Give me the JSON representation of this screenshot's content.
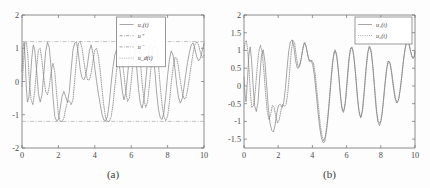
{
  "figure": {
    "background_color": "#fdfdfd",
    "axis_color": "#6e6e6e",
    "curve_color": "#8a8a8a",
    "reference_color": "#a9a9a9"
  },
  "panels": [
    {
      "id": "a",
      "caption": "(a)",
      "legend": {
        "position": "top-center",
        "entries": [
          {
            "label": "u₁(t)",
            "style": "solid"
          },
          {
            "label": "u⁺",
            "style": "dash-dot"
          },
          {
            "label": "u⁻",
            "style": "dash-dot"
          },
          {
            "label": "u_d(t)",
            "style": "dotted"
          }
        ]
      }
    },
    {
      "id": "b",
      "caption": "(b)",
      "legend": {
        "position": "top-right",
        "entries": [
          {
            "label": "u₁(t)",
            "style": "solid"
          },
          {
            "label": "u₂(t)",
            "style": "dotted"
          }
        ]
      }
    }
  ],
  "chart_data": [
    {
      "type": "line",
      "panel": "a",
      "title": "",
      "subtitle": "",
      "xlabel": "",
      "ylabel": "",
      "caption": "(a)",
      "xlim": [
        0,
        10
      ],
      "ylim": [
        -2,
        2
      ],
      "xticks": [
        0,
        2,
        4,
        6,
        8,
        10
      ],
      "yticks": [
        -2,
        -1,
        0,
        1,
        2
      ],
      "xticklabels": [
        "0",
        "2",
        "4",
        "6",
        "8",
        "10"
      ],
      "yticklabels": [
        "-2",
        "-1",
        "0",
        "1",
        "2"
      ],
      "grid": false,
      "legend_position": "top-center",
      "annotations": [
        {
          "type": "hline",
          "label": "u⁺",
          "value": 1.2,
          "style": "dash-dot"
        },
        {
          "type": "hline",
          "label": "u⁻",
          "value": -1.2,
          "style": "dash-dot"
        }
      ],
      "series": [
        {
          "name": "u₁(t)",
          "style": "solid",
          "x": [
            0.0,
            0.06,
            0.12,
            0.18,
            0.24,
            0.3,
            0.38,
            0.46,
            0.54,
            0.62,
            0.7,
            0.8,
            0.9,
            1.0,
            1.1,
            1.2,
            1.3,
            1.4,
            1.5,
            1.6,
            1.7,
            1.8,
            1.9,
            2.0,
            2.1,
            2.2,
            2.3,
            2.4,
            2.5,
            2.6,
            2.7,
            2.8,
            2.9,
            3.0,
            3.1,
            3.2,
            3.3,
            3.4,
            3.5,
            3.6,
            3.7,
            3.8,
            3.9,
            4.0,
            4.1,
            4.2,
            4.3,
            4.4,
            4.5,
            4.6,
            4.7,
            4.8,
            4.9,
            5.0,
            5.1,
            5.2,
            5.3,
            5.4,
            5.5,
            5.6,
            5.7,
            5.8,
            5.9,
            6.0,
            6.1,
            6.2,
            6.3,
            6.4,
            6.5,
            6.6,
            6.7,
            6.8,
            6.9,
            7.0,
            7.1,
            7.2,
            7.3,
            7.4,
            7.5,
            7.6,
            7.7,
            7.8,
            7.9,
            8.0,
            8.1,
            8.2,
            8.3,
            8.4,
            8.5,
            8.6,
            8.7,
            8.8,
            8.9,
            9.0,
            9.1,
            9.2,
            9.3,
            9.4,
            9.5,
            9.6,
            9.7,
            9.8,
            9.9,
            10.0
          ],
          "y": [
            0.3,
            1.05,
            1.18,
            0.6,
            -0.2,
            -0.62,
            -0.48,
            0.1,
            0.72,
            1.1,
            0.95,
            0.35,
            -0.35,
            -0.62,
            -0.4,
            0.25,
            0.9,
            1.18,
            1.02,
            0.4,
            -0.45,
            -1.05,
            -1.18,
            -1.15,
            -0.8,
            -0.45,
            -0.3,
            -0.45,
            -0.62,
            -0.3,
            0.35,
            0.95,
            1.16,
            1.18,
            0.82,
            0.36,
            0.1,
            0.05,
            0.18,
            0.52,
            0.92,
            1.1,
            0.84,
            0.4,
            0.0,
            -0.38,
            -0.7,
            -1.0,
            -1.16,
            -1.18,
            -1.05,
            -0.62,
            -0.05,
            0.45,
            0.8,
            0.96,
            0.72,
            0.26,
            -0.25,
            -0.55,
            -0.36,
            0.18,
            0.74,
            1.08,
            1.18,
            0.95,
            0.42,
            -0.22,
            -0.66,
            -0.8,
            -0.55,
            0.02,
            0.62,
            1.02,
            1.14,
            0.88,
            0.32,
            -0.35,
            -0.85,
            -1.1,
            -1.14,
            -0.92,
            -0.42,
            0.18,
            0.66,
            0.92,
            0.8,
            0.4,
            -0.1,
            -0.48,
            -0.65,
            -0.52,
            -0.18,
            0.22,
            0.58,
            0.88,
            1.1,
            1.16,
            0.98,
            0.74,
            0.62,
            0.7,
            0.92,
            1.14
          ]
        },
        {
          "name": "u_d(t)",
          "style": "dotted",
          "x": [
            0.0,
            0.08,
            0.16,
            0.24,
            0.32,
            0.4,
            0.5,
            0.6,
            0.7,
            0.8,
            0.9,
            1.0,
            1.1,
            1.2,
            1.3,
            1.4,
            1.5,
            1.6,
            1.7,
            1.8,
            1.9,
            2.0,
            2.1,
            2.2,
            2.3,
            2.4,
            2.5,
            2.6,
            2.7,
            2.8,
            2.9,
            3.0,
            3.1,
            3.2,
            3.3,
            3.4,
            3.5,
            3.6,
            3.7,
            3.8,
            3.9,
            4.0,
            4.1,
            4.2,
            4.3,
            4.4,
            4.5,
            4.6,
            4.7,
            4.8,
            4.9,
            5.0,
            5.1,
            5.2,
            5.3,
            5.4,
            5.5,
            5.6,
            5.7,
            5.8,
            5.9,
            6.0,
            6.1,
            6.2,
            6.3,
            6.4,
            6.5,
            6.6,
            6.7,
            6.8,
            6.9,
            7.0,
            7.1,
            7.2,
            7.3,
            7.4,
            7.5,
            7.6,
            7.7,
            7.8,
            7.9,
            8.0,
            8.1,
            8.2,
            8.3,
            8.4,
            8.5,
            8.6,
            8.7,
            8.8,
            8.9,
            9.0,
            9.1,
            9.2,
            9.3,
            9.4,
            9.5,
            9.6,
            9.7,
            9.8,
            9.9,
            10.0
          ],
          "y": [
            -0.15,
            0.55,
            1.15,
            1.2,
            0.8,
            0.05,
            -0.55,
            -0.7,
            -0.3,
            0.4,
            0.95,
            1.0,
            0.6,
            0.1,
            -0.3,
            -0.4,
            -0.15,
            0.28,
            0.55,
            0.3,
            -0.35,
            -1.0,
            -1.2,
            -1.2,
            -1.1,
            -0.82,
            -0.6,
            -0.58,
            -0.7,
            -0.55,
            0.05,
            0.7,
            1.14,
            1.2,
            1.0,
            0.6,
            0.25,
            0.05,
            0.05,
            0.25,
            0.62,
            0.95,
            1.0,
            0.75,
            0.3,
            -0.25,
            -0.75,
            -1.1,
            -1.2,
            -1.2,
            -1.05,
            -0.7,
            -0.15,
            0.35,
            0.7,
            0.82,
            0.65,
            0.22,
            -0.3,
            -0.6,
            -0.5,
            0.0,
            0.58,
            1.02,
            1.2,
            1.08,
            0.62,
            -0.05,
            -0.55,
            -0.78,
            -0.62,
            -0.1,
            0.48,
            0.92,
            1.1,
            0.95,
            0.48,
            -0.18,
            -0.72,
            -1.05,
            -1.18,
            -1.05,
            -0.62,
            -0.05,
            0.42,
            0.72,
            0.7,
            0.42,
            0.02,
            -0.32,
            -0.52,
            -0.5,
            -0.25,
            0.12,
            0.5,
            0.85,
            1.1,
            1.2,
            1.1,
            0.88,
            0.72,
            0.78,
            1.0
          ]
        }
      ]
    },
    {
      "type": "line",
      "panel": "b",
      "title": "",
      "subtitle": "",
      "xlabel": "",
      "ylabel": "",
      "caption": "(b)",
      "xlim": [
        0,
        10
      ],
      "ylim": [
        -1.75,
        2
      ],
      "xticks": [
        0,
        2,
        4,
        6,
        8,
        10
      ],
      "yticks": [
        -1.5,
        -1,
        -0.5,
        0,
        0.5,
        1,
        1.5,
        2
      ],
      "xticklabels": [
        "0",
        "2",
        "4",
        "6",
        "8",
        "10"
      ],
      "yticklabels": [
        "-1.5",
        "-1",
        "-0.5",
        "0",
        "0.5",
        "1",
        "1.5",
        "2"
      ],
      "grid": false,
      "legend_position": "top-right",
      "annotations": [],
      "series": [
        {
          "name": "u₁(t)",
          "style": "solid",
          "x": [
            0.0,
            0.06,
            0.12,
            0.2,
            0.28,
            0.36,
            0.44,
            0.52,
            0.62,
            0.72,
            0.82,
            0.92,
            1.02,
            1.12,
            1.22,
            1.32,
            1.42,
            1.52,
            1.62,
            1.72,
            1.82,
            1.92,
            2.02,
            2.12,
            2.22,
            2.32,
            2.42,
            2.52,
            2.62,
            2.72,
            2.82,
            2.92,
            3.02,
            3.12,
            3.22,
            3.32,
            3.42,
            3.52,
            3.62,
            3.72,
            3.82,
            3.92,
            4.02,
            4.12,
            4.22,
            4.32,
            4.42,
            4.52,
            4.62,
            4.72,
            4.82,
            4.92,
            5.02,
            5.12,
            5.22,
            5.32,
            5.42,
            5.52,
            5.62,
            5.72,
            5.82,
            5.92,
            6.02,
            6.12,
            6.22,
            6.32,
            6.42,
            6.52,
            6.62,
            6.72,
            6.82,
            6.92,
            7.02,
            7.12,
            7.22,
            7.32,
            7.42,
            7.52,
            7.62,
            7.72,
            7.82,
            7.92,
            8.02,
            8.12,
            8.22,
            8.32,
            8.42,
            8.52,
            8.62,
            8.72,
            8.82,
            8.92,
            9.02,
            9.12,
            9.22,
            9.32,
            9.42,
            9.52,
            9.62,
            9.72,
            9.82,
            9.92,
            10.0
          ],
          "y": [
            0.25,
            -0.25,
            -0.45,
            0.15,
            0.85,
            1.1,
            0.75,
            0.1,
            -0.55,
            -0.72,
            -0.45,
            0.25,
            0.85,
            1.02,
            0.7,
            0.05,
            -0.6,
            -1.05,
            -1.25,
            -1.3,
            -1.1,
            -0.75,
            -0.55,
            -0.52,
            -0.6,
            -0.48,
            -0.08,
            0.5,
            1.0,
            1.25,
            1.3,
            1.1,
            0.7,
            0.5,
            0.52,
            0.7,
            1.0,
            1.22,
            1.15,
            0.88,
            0.7,
            0.72,
            0.6,
            0.28,
            -0.2,
            -0.7,
            -1.15,
            -1.45,
            -1.6,
            -1.58,
            -1.3,
            -0.85,
            -0.3,
            0.3,
            0.78,
            1.02,
            0.88,
            0.42,
            -0.18,
            -0.62,
            -0.75,
            -0.48,
            0.12,
            0.7,
            1.05,
            1.1,
            0.85,
            0.35,
            -0.25,
            -0.7,
            -0.9,
            -0.7,
            -0.18,
            0.42,
            0.9,
            1.12,
            1.02,
            0.6,
            0.0,
            -0.6,
            -1.0,
            -1.12,
            -0.98,
            -0.58,
            -0.05,
            0.42,
            0.7,
            0.68,
            0.4,
            0.0,
            -0.32,
            -0.48,
            -0.42,
            -0.15,
            0.25,
            0.7,
            1.05,
            1.25,
            1.22,
            1.02,
            0.82,
            0.78,
            0.95,
            1.12
          ]
        },
        {
          "name": "u₂(t)",
          "style": "dotted",
          "x": [
            0.0,
            0.06,
            0.14,
            0.22,
            0.3,
            0.38,
            0.46,
            0.56,
            0.66,
            0.76,
            0.86,
            0.96,
            1.06,
            1.16,
            1.26,
            1.36,
            1.46,
            1.56,
            1.66,
            1.76,
            1.86,
            1.96,
            2.06,
            2.16,
            2.26,
            2.36,
            2.46,
            2.56,
            2.66,
            2.76,
            2.86,
            2.96,
            3.06,
            3.16,
            3.26,
            3.36,
            3.46,
            3.56,
            3.66,
            3.76,
            3.86,
            3.96,
            4.06,
            4.16,
            4.26,
            4.36,
            4.46,
            4.56,
            4.66,
            4.76,
            4.86,
            4.96,
            5.06,
            5.16,
            5.26,
            5.36,
            5.46,
            5.56,
            5.66,
            5.76,
            5.86,
            5.96,
            6.06,
            6.16,
            6.26,
            6.36,
            6.46,
            6.56,
            6.66,
            6.76,
            6.86,
            6.96,
            7.06,
            7.16,
            7.26,
            7.36,
            7.46,
            7.56,
            7.66,
            7.76,
            7.86,
            7.96,
            8.06,
            8.16,
            8.26,
            8.36,
            8.46,
            8.56,
            8.66,
            8.76,
            8.86,
            8.96,
            9.06,
            9.16,
            9.26,
            9.36,
            9.46,
            9.56,
            9.66,
            9.76,
            9.86,
            9.96,
            10.0
          ],
          "y": [
            1.0,
            1.22,
            1.28,
            1.0,
            0.4,
            -0.25,
            -0.6,
            -0.55,
            -0.15,
            0.45,
            0.95,
            1.15,
            0.95,
            0.45,
            -0.2,
            -0.72,
            -0.95,
            -0.8,
            -0.55,
            -0.6,
            -0.85,
            -1.05,
            -0.95,
            -0.7,
            -0.52,
            -0.58,
            -0.52,
            -0.2,
            0.35,
            0.95,
            1.28,
            1.22,
            0.82,
            0.55,
            0.58,
            0.8,
            1.1,
            1.22,
            1.05,
            0.8,
            0.68,
            0.72,
            0.65,
            0.35,
            -0.12,
            -0.62,
            -1.1,
            -1.42,
            -1.55,
            -1.42,
            -1.05,
            -0.55,
            0.05,
            0.6,
            0.95,
            0.98,
            0.7,
            0.2,
            -0.35,
            -0.7,
            -0.68,
            -0.35,
            0.25,
            0.8,
            1.08,
            1.02,
            0.68,
            0.15,
            -0.45,
            -0.82,
            -0.88,
            -0.6,
            -0.05,
            0.55,
            0.98,
            1.1,
            0.92,
            0.45,
            -0.15,
            -0.72,
            -1.02,
            -1.05,
            -0.85,
            -0.42,
            0.1,
            0.52,
            0.7,
            0.62,
            0.32,
            -0.05,
            -0.35,
            -0.48,
            -0.35,
            -0.02,
            0.42,
            0.85,
            1.15,
            1.28,
            1.18,
            0.95,
            0.78,
            0.82,
            1.0
          ]
        }
      ]
    }
  ]
}
